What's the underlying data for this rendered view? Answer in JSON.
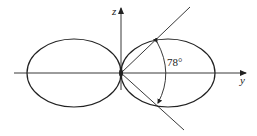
{
  "diagram": {
    "type": "polar-lobe-pattern",
    "colors": {
      "stroke": "#222222",
      "background": "#ffffff"
    },
    "axes": {
      "horizontal": {
        "label": "y"
      },
      "vertical": {
        "label": "z"
      }
    },
    "lobes": [
      {
        "side": "left"
      },
      {
        "side": "right"
      }
    ],
    "angle_annotation": {
      "label": "78°",
      "value_degrees": 78
    }
  }
}
